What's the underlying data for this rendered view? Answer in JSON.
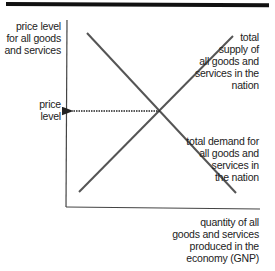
{
  "diagram": {
    "y_axis_label": [
      "price level",
      "for all goods",
      "and services"
    ],
    "price_level_label": [
      "price",
      "level"
    ],
    "supply_label": [
      "total",
      "supply of",
      "all goods and",
      "services in the",
      "nation"
    ],
    "demand_label": [
      "total demand for",
      "all goods and",
      "services in",
      "the nation"
    ],
    "x_axis_label": [
      "quantity of all",
      "goods and services",
      "produced in the",
      "economy (GNP)"
    ],
    "colors": {
      "curve": "#555555",
      "axis": "#444444",
      "arrow": "#222222",
      "top_bar": "#111111"
    }
  }
}
